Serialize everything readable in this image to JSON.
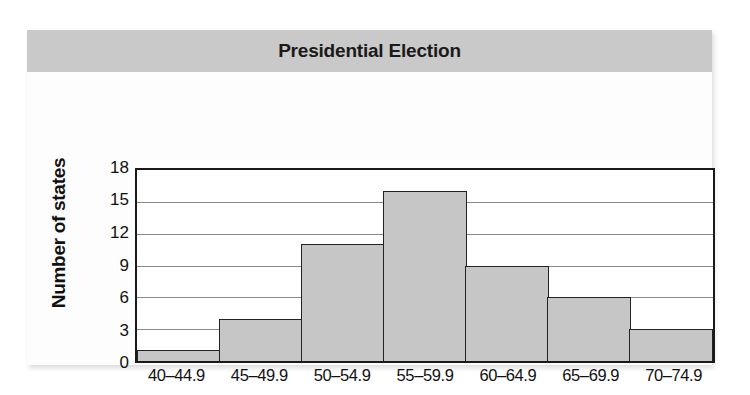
{
  "card": {
    "title": "Presidential Election"
  },
  "chart_data": {
    "type": "bar",
    "title": "Presidential Election",
    "subtitle": "",
    "xlabel": "Percent of voting age population",
    "ylabel": "Number of states",
    "categories": [
      "40–44.9",
      "45–49.9",
      "50–54.9",
      "55–59.9",
      "60–64.9",
      "65–69.9",
      "70–74.9"
    ],
    "values": [
      1,
      4,
      11,
      16,
      9,
      6,
      3
    ],
    "ylim": [
      0,
      18
    ],
    "yticks": [
      0,
      3,
      6,
      9,
      12,
      15,
      18
    ],
    "ytick_labels": [
      "0",
      "3",
      "6",
      "9",
      "12",
      "15",
      "18"
    ],
    "grid": "horizontal",
    "legend": "none",
    "bar_fill_color": "#c6c6c6",
    "bar_border_color": "#222222",
    "title_band_color": "#c9c9c9",
    "gridline_color": "#8b8b8b",
    "axis_color": "#1a1a1a"
  }
}
